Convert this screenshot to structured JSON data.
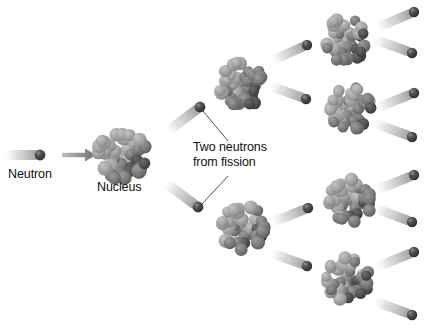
{
  "diagram": {
    "background_color": "#ffffff",
    "width": 432,
    "height": 333
  },
  "labels": {
    "neutron": "Neutron",
    "nucleus": "Nucleus",
    "fission_line1": "Two neutrons",
    "fission_line2": "from fission"
  },
  "colors": {
    "text": "#101010",
    "neutron_dark": "#3a3a3a",
    "neutron_mid": "#5e5e5e",
    "trail_start": "#f4f4f4",
    "trail_end": "#9e9e9e",
    "nucleon_light": "#a2a2a2",
    "nucleon_mid": "#757575",
    "nucleon_dark": "#474747",
    "arrow": "#8c8c8c",
    "leader_line": "#3c3c3c"
  },
  "arrow": {
    "name": "incoming-direction-arrow",
    "x1": 62,
    "y1": 155,
    "x2": 96,
    "y2": 155
  },
  "leader_lines": [
    {
      "name": "leader-to-upper-neutron",
      "x1": 203,
      "y1": 111,
      "x2": 228,
      "y2": 141
    },
    {
      "name": "leader-to-lower-neutron",
      "x1": 202,
      "y1": 204,
      "x2": 228,
      "y2": 176
    }
  ],
  "nuclei": [
    {
      "name": "nucleus-generation-1",
      "cx": 122,
      "cy": 155,
      "r": 27,
      "seed": 1
    },
    {
      "name": "nucleus-generation-2-upper",
      "cx": 241,
      "cy": 85,
      "r": 25,
      "seed": 2
    },
    {
      "name": "nucleus-generation-2-lower",
      "cx": 243,
      "cy": 228,
      "r": 25,
      "seed": 3
    },
    {
      "name": "nucleus-generation-3-a",
      "cx": 345,
      "cy": 40,
      "r": 24,
      "seed": 4
    },
    {
      "name": "nucleus-generation-3-b",
      "cx": 350,
      "cy": 108,
      "r": 24,
      "seed": 5
    },
    {
      "name": "nucleus-generation-3-c",
      "cx": 350,
      "cy": 201,
      "r": 24,
      "seed": 6
    },
    {
      "name": "nucleus-generation-3-d",
      "cx": 348,
      "cy": 279,
      "r": 24,
      "seed": 7
    }
  ],
  "neutrons": [
    {
      "name": "neutron-incident",
      "cx": 40,
      "cy": 155,
      "r": 5.4,
      "angle": 0,
      "trail": 38
    },
    {
      "name": "neutron-gen2-upper",
      "cx": 200,
      "cy": 107,
      "r": 5.4,
      "angle": -37,
      "trail": 45
    },
    {
      "name": "neutron-gen2-lower",
      "cx": 198,
      "cy": 207,
      "r": 5.4,
      "angle": 37,
      "trail": 45
    },
    {
      "name": "neutron-gen3-a",
      "cx": 307,
      "cy": 45,
      "r": 5.2,
      "angle": -24,
      "trail": 42
    },
    {
      "name": "neutron-gen3-b",
      "cx": 306,
      "cy": 99,
      "r": 5.2,
      "angle": 20,
      "trail": 42
    },
    {
      "name": "neutron-gen3-c",
      "cx": 308,
      "cy": 208,
      "r": 5.2,
      "angle": -22,
      "trail": 42
    },
    {
      "name": "neutron-gen3-d",
      "cx": 307,
      "cy": 266,
      "r": 5.2,
      "angle": 20,
      "trail": 42
    },
    {
      "name": "neutron-gen4-a1",
      "cx": 414,
      "cy": 12,
      "r": 5.2,
      "angle": -23,
      "trail": 44
    },
    {
      "name": "neutron-gen4-a2",
      "cx": 412,
      "cy": 53,
      "r": 5.2,
      "angle": 20,
      "trail": 44
    },
    {
      "name": "neutron-gen4-b1",
      "cx": 414,
      "cy": 93,
      "r": 5.2,
      "angle": -22,
      "trail": 44
    },
    {
      "name": "neutron-gen4-b2",
      "cx": 412,
      "cy": 137,
      "r": 5.2,
      "angle": 20,
      "trail": 44
    },
    {
      "name": "neutron-gen4-c1",
      "cx": 414,
      "cy": 175,
      "r": 5.2,
      "angle": -22,
      "trail": 44
    },
    {
      "name": "neutron-gen4-c2",
      "cx": 412,
      "cy": 222,
      "r": 5.2,
      "angle": 20,
      "trail": 44
    },
    {
      "name": "neutron-gen4-d1",
      "cx": 414,
      "cy": 252,
      "r": 5.2,
      "angle": -22,
      "trail": 44
    },
    {
      "name": "neutron-gen4-d2",
      "cx": 412,
      "cy": 315,
      "r": 5.2,
      "angle": 20,
      "trail": 44
    }
  ]
}
